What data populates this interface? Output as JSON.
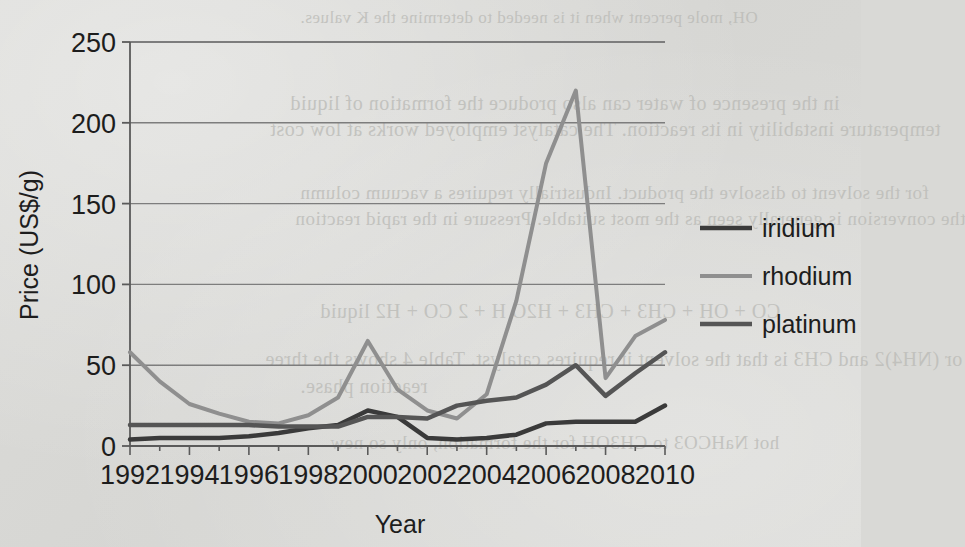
{
  "page": {
    "background_color": "#d9d9d6",
    "bleed_through_text": [
      "OH, mole percent when it is needed to determine the K values.",
      "in the presence of water can also produce the formation of liquid",
      "temperature instability in its reaction. The catalyst employed works at low cost",
      "for the solvent to dissolve the product. Industrially requires a vacuum column",
      "the conversion is generally seen as the most suitable. Pressure in the rapid reaction",
      "CO + OH + CH3 + CH3 + H2O          H + 2 CO + H2 liquid",
      "or (NH4)2 and CH3 is that the solvent it requires catalyst. Table 4 shows the three",
      "reaction phase.",
      "hot NaHCO3 to CH3OH for the formation, only so new"
    ]
  },
  "chart_data": {
    "type": "line",
    "title": "",
    "xlabel": "Year",
    "ylabel": "Price (US$/g)",
    "x": [
      1992,
      1993,
      1994,
      1995,
      1996,
      1997,
      1998,
      1999,
      2000,
      2001,
      2002,
      2003,
      2004,
      2005,
      2006,
      2007,
      2008,
      2009,
      2010
    ],
    "xlim": [
      1992,
      2010
    ],
    "ylim": [
      0,
      250
    ],
    "yticks": [
      0,
      50,
      100,
      150,
      200,
      250
    ],
    "xticks": [
      1992,
      1994,
      1996,
      1998,
      2000,
      2002,
      2004,
      2006,
      2008,
      2010
    ],
    "xtick_labels": [
      "1992",
      "1994",
      "1996",
      "1998",
      "2000",
      "2002",
      "2004",
      "2006",
      "2008",
      "2010"
    ],
    "ytick_labels": [
      "0",
      "50",
      "100",
      "150",
      "200",
      "250"
    ],
    "grid": "horizontal",
    "legend_position": "right",
    "series": [
      {
        "name": "iridium",
        "color": "#3a3a3a",
        "width": 4.5,
        "values": [
          4,
          5,
          5,
          5,
          6,
          8,
          11,
          13,
          22,
          18,
          5,
          4,
          5,
          7,
          14,
          15,
          15,
          15,
          25
        ]
      },
      {
        "name": "rhodium",
        "color": "#8f8f8f",
        "width": 4.0,
        "values": [
          58,
          40,
          26,
          20,
          15,
          14,
          19,
          30,
          65,
          35,
          22,
          17,
          32,
          90,
          175,
          220,
          42,
          68,
          78
        ]
      },
      {
        "name": "platinum",
        "color": "#555555",
        "width": 4.5,
        "values": [
          13,
          13,
          13,
          13,
          13,
          12,
          12,
          12,
          18,
          18,
          17,
          25,
          28,
          30,
          38,
          50,
          31,
          45,
          58
        ]
      }
    ]
  },
  "legend": {
    "entries": [
      {
        "label": "iridium"
      },
      {
        "label": "rhodium"
      },
      {
        "label": "platinum"
      }
    ]
  },
  "axes": {
    "x_title": "Year",
    "y_title": "Price (US$/g)"
  }
}
